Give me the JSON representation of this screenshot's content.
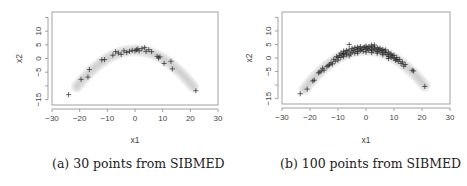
{
  "figure": {
    "panels": [
      {
        "id": "a",
        "caption": "(a) 30 points from SIBMED"
      },
      {
        "id": "b",
        "caption": "(b) 100 points from SIBMED"
      }
    ]
  },
  "chart_data": [
    {
      "type": "scatter",
      "title": "",
      "caption": "(a) 30 points from SIBMED",
      "xlabel": "x1",
      "ylabel": "x2",
      "xlim": [
        -30,
        30
      ],
      "ylim": [
        -17,
        17
      ],
      "xticks": [
        -30,
        -20,
        -10,
        0,
        10,
        20,
        30
      ],
      "yticks": [
        -15,
        -10,
        -5,
        0,
        5,
        10,
        15
      ],
      "ytick_labels": [
        "-15",
        "",
        "-5",
        "0",
        "5",
        "10",
        ""
      ],
      "grid": false,
      "marker": "+",
      "background_band": "grey parabolic density band, x2 ≈ 3 - 0.03*x1^2, from x1≈-21 to x1≈21",
      "points": [
        [
          -24,
          -13.2
        ],
        [
          -19.5,
          -7.6
        ],
        [
          -17,
          -6.8
        ],
        [
          -16.5,
          -4
        ],
        [
          -12,
          -0.5
        ],
        [
          -11,
          -0.4
        ],
        [
          -8,
          1.2
        ],
        [
          -7,
          2.5
        ],
        [
          -6,
          2
        ],
        [
          -5,
          1.5
        ],
        [
          -4,
          2.8
        ],
        [
          -3,
          2.2
        ],
        [
          -2,
          2.6
        ],
        [
          -1,
          3
        ],
        [
          0,
          2.8
        ],
        [
          0.5,
          3.2
        ],
        [
          1,
          3.5
        ],
        [
          1.5,
          2.8
        ],
        [
          2.5,
          3.6
        ],
        [
          3.5,
          4
        ],
        [
          4,
          2.6
        ],
        [
          5,
          3.2
        ],
        [
          6,
          2.5
        ],
        [
          8,
          0.8
        ],
        [
          8.5,
          0.2
        ],
        [
          9,
          0.6
        ],
        [
          10.5,
          -1.8
        ],
        [
          13,
          -1
        ],
        [
          13.5,
          -3.8
        ],
        [
          22,
          -11.8
        ]
      ]
    },
    {
      "type": "scatter",
      "title": "",
      "caption": "(b) 100 points from SIBMED",
      "xlabel": "x1",
      "ylabel": "x2",
      "xlim": [
        -30,
        30
      ],
      "ylim": [
        -17,
        17
      ],
      "xticks": [
        -30,
        -20,
        -10,
        0,
        10,
        20,
        30
      ],
      "yticks": [
        -15,
        -10,
        -5,
        0,
        5,
        10,
        15
      ],
      "ytick_labels": [
        "-15",
        "",
        "-5",
        "0",
        "5",
        "10",
        ""
      ],
      "grid": false,
      "marker": "+",
      "background_band": "grey parabolic density band, x2 ≈ 3 - 0.03*x1^2, from x1≈-22 to x1≈21",
      "points": [
        [
          -23.5,
          -13.2
        ],
        [
          -21,
          -11.5
        ],
        [
          -19,
          -8.5
        ],
        [
          -18.5,
          -8.2
        ],
        [
          -17,
          -5.5
        ],
        [
          -16.5,
          -5.2
        ],
        [
          -16,
          -4.8
        ],
        [
          -15,
          -4.5
        ],
        [
          -15.5,
          -3.8
        ],
        [
          -13,
          -2.5
        ],
        [
          -12.5,
          -1.8
        ],
        [
          -12,
          -2.2
        ],
        [
          -11.5,
          -0.5
        ],
        [
          -11,
          -1.2
        ],
        [
          -10.5,
          0.5
        ],
        [
          -10,
          -0.8
        ],
        [
          -9.5,
          1
        ],
        [
          -9,
          0.2
        ],
        [
          -9,
          1.8
        ],
        [
          -8.5,
          1.2
        ],
        [
          -8,
          2.5
        ],
        [
          -8,
          0.5
        ],
        [
          -7.5,
          1.8
        ],
        [
          -7,
          2.8
        ],
        [
          -7,
          1.2
        ],
        [
          -6.5,
          2.2
        ],
        [
          -6,
          5
        ],
        [
          -6,
          3
        ],
        [
          -5.5,
          1.5
        ],
        [
          -5,
          3.5
        ],
        [
          -5,
          2.2
        ],
        [
          -4.5,
          2.8
        ],
        [
          -4,
          3.8
        ],
        [
          -4,
          1.8
        ],
        [
          -3.5,
          3.2
        ],
        [
          -3,
          4
        ],
        [
          -3,
          2.4
        ],
        [
          -2.5,
          3.5
        ],
        [
          -2,
          2.8
        ],
        [
          -2,
          4.2
        ],
        [
          -1.5,
          3.2
        ],
        [
          -1,
          3.8
        ],
        [
          -1,
          2.5
        ],
        [
          -0.5,
          4
        ],
        [
          0,
          3.2
        ],
        [
          0,
          4.4
        ],
        [
          0.5,
          3.6
        ],
        [
          1,
          2.8
        ],
        [
          1,
          4.2
        ],
        [
          1.5,
          3.8
        ],
        [
          2,
          4.8
        ],
        [
          2,
          3.2
        ],
        [
          2.5,
          4.2
        ],
        [
          2.5,
          2.6
        ],
        [
          3,
          3.6
        ],
        [
          3,
          4.8
        ],
        [
          3.5,
          3
        ],
        [
          4,
          3.8
        ],
        [
          4,
          2.4
        ],
        [
          4.5,
          3.2
        ],
        [
          5,
          3.6
        ],
        [
          5,
          2.2
        ],
        [
          5.5,
          2.8
        ],
        [
          6,
          3.2
        ],
        [
          6,
          1.8
        ],
        [
          6.5,
          2.6
        ],
        [
          7,
          2
        ],
        [
          7,
          3
        ],
        [
          7.5,
          1.2
        ],
        [
          8,
          2.2
        ],
        [
          8,
          0.6
        ],
        [
          8.5,
          1.5
        ],
        [
          9,
          0.2
        ],
        [
          9,
          1.4
        ],
        [
          9.5,
          0.8
        ],
        [
          10,
          -0.2
        ],
        [
          10,
          1
        ],
        [
          10.5,
          -0.8
        ],
        [
          11,
          0.2
        ],
        [
          11.5,
          -1.2
        ],
        [
          12,
          -0.5
        ],
        [
          12.5,
          -2
        ],
        [
          13,
          -1.5
        ],
        [
          13.5,
          -3
        ],
        [
          14,
          -2.4
        ],
        [
          16.5,
          -4.5
        ],
        [
          17,
          -4.8
        ],
        [
          21,
          -10.5
        ],
        [
          -14,
          -3.2
        ],
        [
          -13.5,
          -2.8
        ],
        [
          -10,
          0.2
        ],
        [
          -8,
          1.6
        ],
        [
          -6,
          0.8
        ],
        [
          -3,
          1.8
        ],
        [
          0,
          2.2
        ],
        [
          2,
          2
        ],
        [
          4,
          1.8
        ],
        [
          6,
          1.2
        ],
        [
          8,
          -0.2
        ],
        [
          11,
          -0.6
        ]
      ]
    }
  ]
}
